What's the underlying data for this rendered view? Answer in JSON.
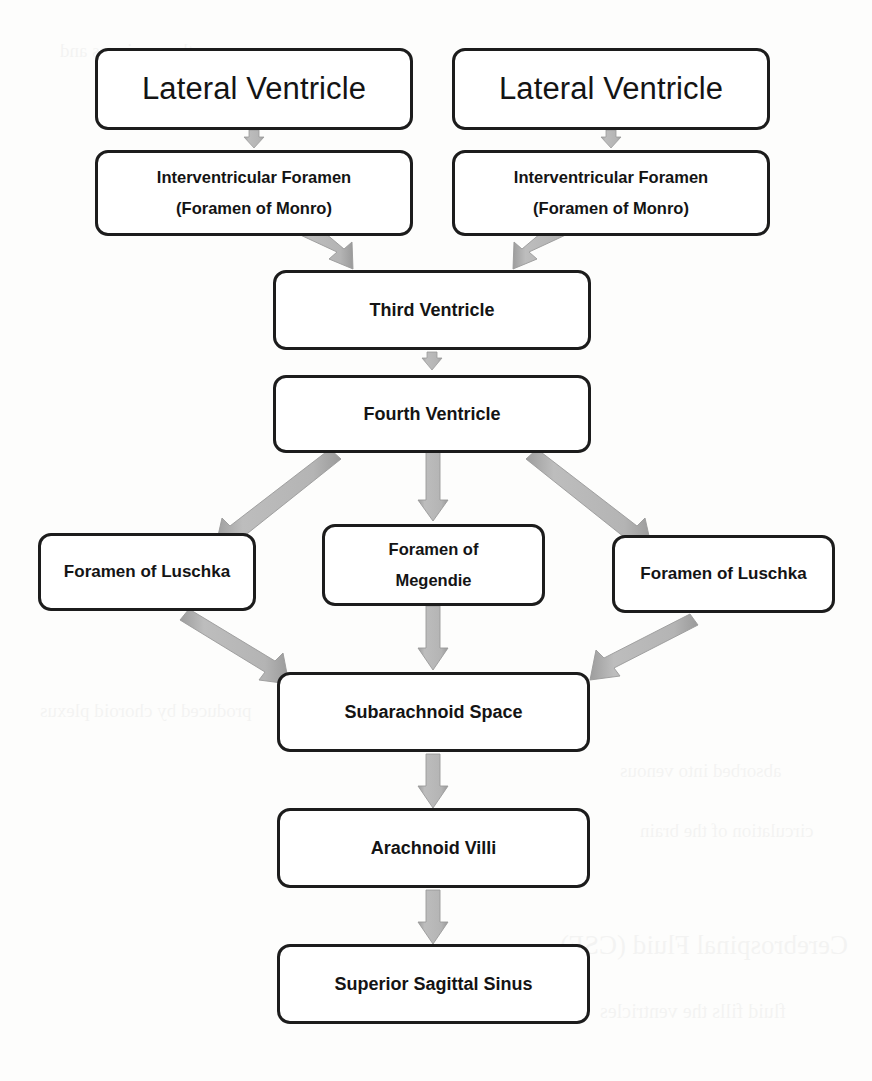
{
  "diagram": {
    "type": "flowchart",
    "background_color": "#fdfdfc",
    "box_border_color": "#1c1c1c",
    "box_fill_color": "#ffffff",
    "arrow_color": "#b3b3b3",
    "arrow_edge_color": "#9a9a9a",
    "nodes": [
      {
        "id": "lateral-ventricle-left",
        "label": "Lateral Ventricle",
        "line2": ""
      },
      {
        "id": "lateral-ventricle-right",
        "label": "Lateral Ventricle",
        "line2": ""
      },
      {
        "id": "foramen-monro-left",
        "label": "Interventricular Foramen",
        "line2": "(Foramen of Monro)"
      },
      {
        "id": "foramen-monro-right",
        "label": "Interventricular Foramen",
        "line2": "(Foramen of Monro)"
      },
      {
        "id": "third-ventricle",
        "label": "Third Ventricle",
        "line2": ""
      },
      {
        "id": "fourth-ventricle",
        "label": "Fourth Ventricle",
        "line2": ""
      },
      {
        "id": "foramen-luschka-left",
        "label": "Foramen of Luschka",
        "line2": ""
      },
      {
        "id": "foramen-megendie",
        "label": "Foramen of",
        "line2": "Megendie"
      },
      {
        "id": "foramen-luschka-right",
        "label": "Foramen of Luschka",
        "line2": ""
      },
      {
        "id": "subarachnoid-space",
        "label": "Subarachnoid Space",
        "line2": ""
      },
      {
        "id": "arachnoid-villi",
        "label": "Arachnoid Villi",
        "line2": ""
      },
      {
        "id": "superior-sagittal-sinus",
        "label": "Superior Sagittal Sinus",
        "line2": ""
      }
    ],
    "edges": [
      {
        "from": "lateral-ventricle-left",
        "to": "foramen-monro-left",
        "style": "vertical-short"
      },
      {
        "from": "lateral-ventricle-right",
        "to": "foramen-monro-right",
        "style": "vertical-short"
      },
      {
        "from": "foramen-monro-left",
        "to": "third-ventricle",
        "style": "diagonal"
      },
      {
        "from": "foramen-monro-right",
        "to": "third-ventricle",
        "style": "diagonal"
      },
      {
        "from": "third-ventricle",
        "to": "fourth-ventricle",
        "style": "vertical-short"
      },
      {
        "from": "fourth-ventricle",
        "to": "foramen-luschka-left",
        "style": "diagonal"
      },
      {
        "from": "fourth-ventricle",
        "to": "foramen-megendie",
        "style": "vertical"
      },
      {
        "from": "fourth-ventricle",
        "to": "foramen-luschka-right",
        "style": "diagonal"
      },
      {
        "from": "foramen-luschka-left",
        "to": "subarachnoid-space",
        "style": "diagonal"
      },
      {
        "from": "foramen-megendie",
        "to": "subarachnoid-space",
        "style": "vertical"
      },
      {
        "from": "foramen-luschka-right",
        "to": "subarachnoid-space",
        "style": "diagonal"
      },
      {
        "from": "subarachnoid-space",
        "to": "arachnoid-villi",
        "style": "vertical"
      },
      {
        "from": "arachnoid-villi",
        "to": "superior-sagittal-sinus",
        "style": "vertical"
      }
    ]
  }
}
